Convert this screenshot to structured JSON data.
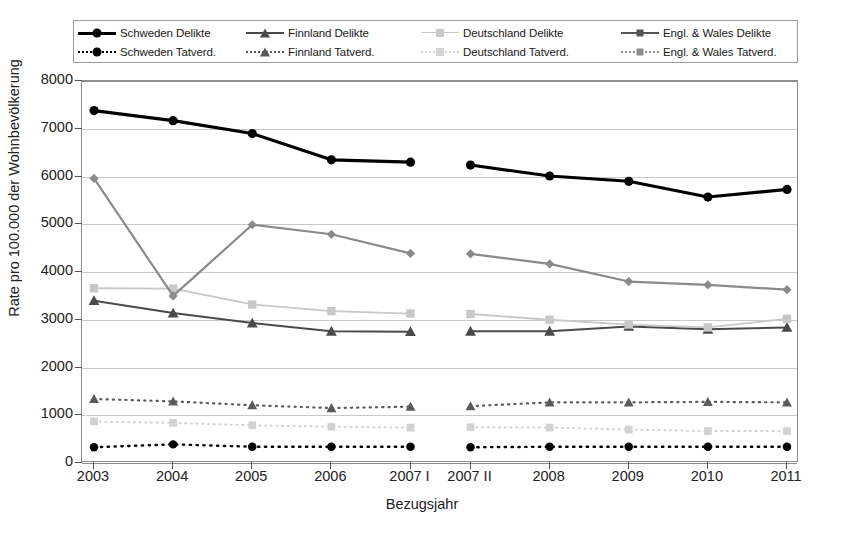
{
  "chart_data": {
    "type": "line",
    "title": "",
    "xlabel": "Bezugsjahr",
    "ylabel": "Rate pro 100.000 der Wohnbevölkerung",
    "ylim": [
      0,
      8000
    ],
    "ytick_step": 1000,
    "yticks": [
      "0",
      "1000",
      "2000",
      "3000",
      "4000",
      "5000",
      "6000",
      "7000",
      "8000"
    ],
    "categories": [
      "2003",
      "2004",
      "2005",
      "2006",
      "2007 I",
      "2007 II",
      "2008",
      "2009",
      "2010",
      "2011"
    ],
    "panel_break_after_index": 4,
    "grid": true,
    "legend_position": "top",
    "series": [
      {
        "name": "Schweden Delikte",
        "marker": "circle",
        "line": "solid",
        "color": "#000000",
        "width": 3.2,
        "values": [
          7380,
          7170,
          6900,
          6350,
          6300,
          6240,
          6010,
          5900,
          5570,
          5730
        ]
      },
      {
        "name": "Finnland Delikte",
        "marker": "triangle",
        "line": "solid",
        "color": "#4a4a4a",
        "width": 2.0,
        "values": [
          3400,
          3140,
          2930,
          2760,
          2750,
          2760,
          2760,
          2860,
          2800,
          2840
        ]
      },
      {
        "name": "Deutschland Delikte",
        "marker": "square",
        "line": "solid",
        "color": "#c8c8c8",
        "width": 1.8,
        "values": [
          3660,
          3650,
          3320,
          3180,
          3130,
          3120,
          3000,
          2900,
          2840,
          3020
        ]
      },
      {
        "name": "Engl. & Wales Delikte",
        "marker": "diamond",
        "line": "solid",
        "color": "#8a8a8a",
        "width": 2.2,
        "values": [
          5960,
          3500,
          4990,
          4790,
          4390,
          4380,
          4170,
          3800,
          3730,
          3630
        ]
      },
      {
        "name": "Schweden Tatverd.",
        "marker": "circle",
        "line": "dotted",
        "color": "#000000",
        "width": 2.4,
        "values": [
          330,
          390,
          340,
          340,
          340,
          330,
          340,
          340,
          340,
          340
        ]
      },
      {
        "name": "Finnland Tatverd.",
        "marker": "triangle",
        "line": "dotted",
        "color": "#5a5a5a",
        "width": 2.2,
        "values": [
          1340,
          1290,
          1210,
          1150,
          1180,
          1190,
          1270,
          1270,
          1280,
          1270
        ]
      },
      {
        "name": "Deutschland Tatverd.",
        "marker": "square",
        "line": "dotted",
        "color": "#d2d2d2",
        "width": 2.0,
        "values": [
          870,
          840,
          790,
          760,
          740,
          750,
          740,
          700,
          670,
          670
        ]
      },
      {
        "name": "Engl. & Wales Tatverd.",
        "marker": "diamond",
        "line": "dotted",
        "color": "#9a9a9a",
        "width": 2.0,
        "values": [
          null,
          null,
          null,
          null,
          null,
          null,
          null,
          null,
          null,
          null
        ]
      }
    ]
  },
  "legend": {
    "items": [
      {
        "label": "Schweden Delikte",
        "marker": "circle",
        "line": "solid",
        "color": "#000000",
        "width": 3.2
      },
      {
        "label": "Finnland Delikte",
        "marker": "triangle",
        "line": "solid",
        "color": "#4a4a4a",
        "width": 2.2
      },
      {
        "label": "Deutschland Delikte",
        "marker": "square",
        "line": "solid",
        "color": "#c8c8c8",
        "width": 1.8
      },
      {
        "label": "Engl. & Wales Delikte",
        "marker": "diamond",
        "line": "solid",
        "color": "#555555",
        "width": 2.4
      },
      {
        "label": "Schweden Tatverd.",
        "marker": "circle",
        "line": "dotted",
        "color": "#000000",
        "width": 2.4
      },
      {
        "label": "Finnland Tatverd.",
        "marker": "triangle",
        "line": "dotted",
        "color": "#5a5a5a",
        "width": 2.2
      },
      {
        "label": "Deutschland Tatverd.",
        "marker": "square",
        "line": "dotted",
        "color": "#d2d2d2",
        "width": 2.2
      },
      {
        "label": "Engl. & Wales Tatverd.",
        "marker": "diamond",
        "line": "dotted",
        "color": "#8a8a8a",
        "width": 2.2
      }
    ]
  },
  "footer": {
    "text": ""
  }
}
